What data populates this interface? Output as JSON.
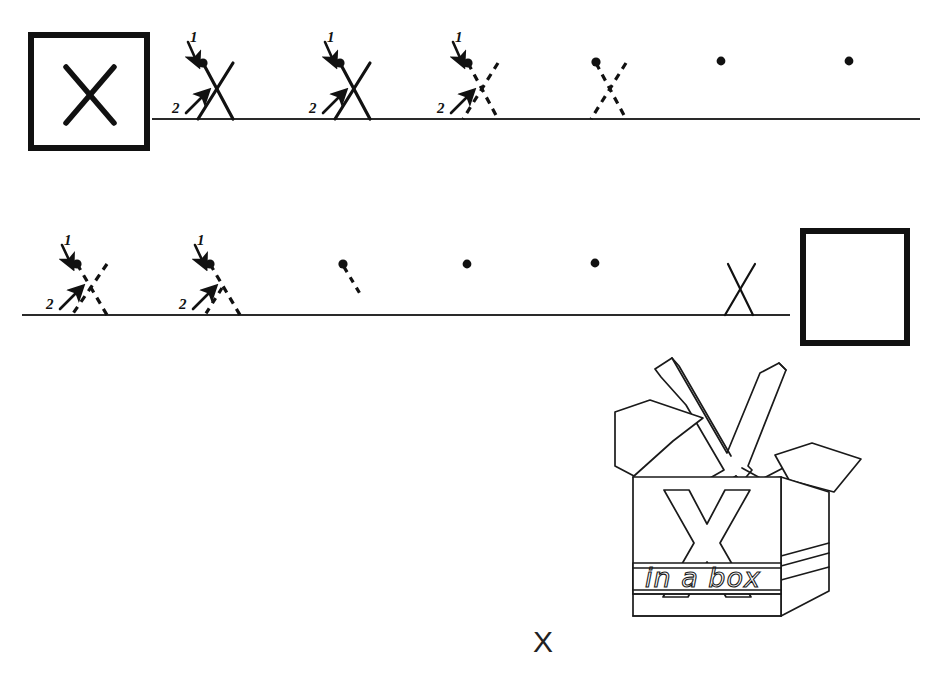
{
  "worksheet": {
    "letter": "X",
    "title": "X handwriting practice worksheet",
    "footer_letter": "X",
    "ink_color": "#1a1a1a",
    "paper_color": "#ffffff"
  },
  "model_box": {
    "name": "model letter box",
    "letter": "X",
    "x": 28,
    "y": 32,
    "width": 122,
    "height": 119,
    "border_width": 6
  },
  "practice_box": {
    "name": "empty practice box",
    "letter": "",
    "x": 800,
    "y": 228,
    "width": 108,
    "height": 117,
    "border_width": 6
  },
  "stroke_guide": {
    "stroke_1_label": "1",
    "stroke_2_label": "2",
    "stroke_1_description": "down-right diagonal from top-left start dot",
    "stroke_2_description": "up-right diagonal from baseline"
  },
  "rows": [
    {
      "row_index": 1,
      "baseline_y": 119,
      "baseline_x_start": 152,
      "baseline_x_end": 920,
      "glyph_top_y": 60,
      "glyphs": [
        {
          "index": 1,
          "x": 198,
          "style": "solid",
          "arrows": true,
          "dot": true,
          "labels": [
            "1",
            "2"
          ]
        },
        {
          "index": 2,
          "x": 335,
          "style": "solid",
          "arrows": true,
          "dot": true,
          "labels": [
            "1",
            "2"
          ]
        },
        {
          "index": 3,
          "x": 463,
          "style": "dashed",
          "arrows": true,
          "dot": true,
          "labels": [
            "1",
            "2"
          ]
        },
        {
          "index": 4,
          "x": 593,
          "style": "dashed",
          "arrows": false,
          "dot": true,
          "labels": []
        },
        {
          "index": 5,
          "x": 720,
          "style": "dot-only",
          "arrows": false,
          "dot": true,
          "labels": []
        },
        {
          "index": 6,
          "x": 848,
          "style": "dot-only",
          "arrows": false,
          "dot": true,
          "labels": []
        }
      ]
    },
    {
      "row_index": 2,
      "baseline_y": 315,
      "baseline_x_start": 22,
      "baseline_x_end": 790,
      "glyph_top_y": 263,
      "glyphs": [
        {
          "index": 1,
          "x": 72,
          "style": "dashed",
          "arrows": true,
          "dot": true,
          "labels": [
            "1",
            "2"
          ]
        },
        {
          "index": 2,
          "x": 205,
          "style": "dashed-partial",
          "arrows": true,
          "dot": true,
          "labels": [
            "1",
            "2"
          ]
        },
        {
          "index": 3,
          "x": 342,
          "style": "stub",
          "arrows": false,
          "dot": true,
          "labels": []
        },
        {
          "index": 4,
          "x": 466,
          "style": "dot-only",
          "arrows": false,
          "dot": true,
          "labels": []
        },
        {
          "index": 5,
          "x": 594,
          "style": "dot-only",
          "arrows": false,
          "dot": true,
          "labels": []
        },
        {
          "index": 6,
          "x": 726,
          "style": "thin-written",
          "arrows": false,
          "dot": false,
          "labels": []
        }
      ]
    }
  ],
  "illustration": {
    "name": "x-in-a-box",
    "caption": "in a box",
    "front_letter": "X",
    "popping_letter": "X",
    "x": 615,
    "y": 350,
    "width": 250,
    "height": 280
  }
}
